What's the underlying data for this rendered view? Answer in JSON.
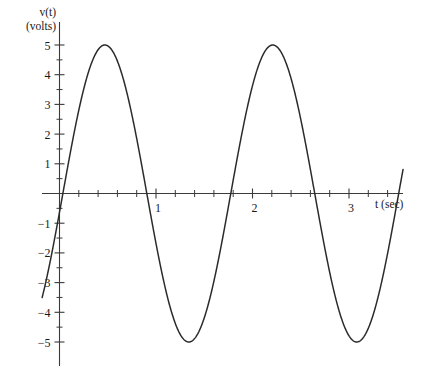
{
  "figure": {
    "background_color": "#ffffff",
    "curve_color": "#2b2b2b",
    "axis_color": "#3a3a3a"
  },
  "axis_labels": {
    "y_line1": "v(t)",
    "y_line2": "(volts)",
    "x_label": "t (sec)"
  },
  "y_ticks": [
    {
      "value": 5,
      "label": "5"
    },
    {
      "value": 4,
      "label": "4"
    },
    {
      "value": 3,
      "label": "3"
    },
    {
      "value": 2,
      "label": "2"
    },
    {
      "value": 1,
      "label": "1"
    },
    {
      "value": 0,
      "label": ""
    },
    {
      "value": -1,
      "label": "−1"
    },
    {
      "value": -2,
      "label": "−2"
    },
    {
      "value": -3,
      "label": "−3"
    },
    {
      "value": -4,
      "label": "−4"
    },
    {
      "value": -5,
      "label": "−5"
    }
  ],
  "y_minor_ticks": [
    4.5,
    3.5,
    2.5,
    1.5,
    0.5,
    -0.5,
    -1.5,
    -2.5,
    -3.5,
    -4.5
  ],
  "x_ticks": [
    {
      "value": 1,
      "label": "1"
    },
    {
      "value": 2,
      "label": "2"
    },
    {
      "value": 3,
      "label": "3"
    }
  ],
  "x_minor_ticks": [
    0.2,
    0.4,
    0.6,
    0.8,
    1.2,
    1.4,
    1.6,
    1.8,
    2.2,
    2.4,
    2.6,
    2.8,
    3.2,
    3.4
  ],
  "chart_data": {
    "type": "line",
    "title": "",
    "xlabel": "t (sec)",
    "ylabel": "v(t) (volts)",
    "xlim": [
      -0.18,
      3.6
    ],
    "ylim": [
      -5.6,
      5.6
    ],
    "grid": false,
    "legend": "none",
    "xticks": [
      1,
      2,
      3
    ],
    "xticklabels": [
      "1",
      "2",
      "3"
    ],
    "yticks": [
      -5,
      -4,
      -3,
      -2,
      -1,
      0,
      1,
      2,
      3,
      4,
      5
    ],
    "yticklabels": [
      "−5",
      "−4",
      "−3",
      "−2",
      "−1",
      "",
      "1",
      "2",
      "3",
      "4",
      "5"
    ],
    "series": [
      {
        "name": "v(t)",
        "form": "sinusoid",
        "amplitude": 5,
        "period_sec": 1.74,
        "frequency_hz": 0.575,
        "phase_zero_crossing_rising_sec": 0.035,
        "equation": "v(t) = 5 sin(2π(t − 0.035)/1.74)",
        "x": [
          -0.18,
          -0.1,
          0.0,
          0.1,
          0.2,
          0.3,
          0.4,
          0.47,
          0.6,
          0.7,
          0.8,
          0.9,
          1.0,
          1.1,
          1.2,
          1.3,
          1.34,
          1.45,
          1.55,
          1.65,
          1.75,
          1.85,
          1.95,
          2.05,
          2.21,
          2.35,
          2.45,
          2.55,
          2.65,
          2.75,
          2.85,
          2.95,
          3.05,
          3.08,
          3.2,
          3.3,
          3.4,
          3.5,
          3.55
        ],
        "y": [
          -4.75,
          -2.42,
          0.63,
          3.08,
          4.45,
          4.99,
          4.51,
          3.92,
          2.0,
          0.36,
          -1.4,
          -2.96,
          -4.13,
          -4.82,
          -4.98,
          -4.53,
          -4.33,
          -3.09,
          -1.63,
          0.09,
          1.78,
          3.26,
          4.4,
          4.93,
          5.0,
          4.3,
          3.28,
          1.9,
          0.27,
          -1.42,
          -2.98,
          -4.2,
          -4.9,
          -4.95,
          -4.64,
          -3.78,
          -2.5,
          -0.95,
          -1.4
        ],
        "key_points": {
          "maxima": [
            {
              "t": 0.47,
              "v": 5.0
            },
            {
              "t": 2.21,
              "v": 5.0
            }
          ],
          "minima": [
            {
              "t": 1.34,
              "v": -4.95
            },
            {
              "t": 3.08,
              "v": -4.95
            }
          ],
          "zero_crossings": [
            0.035,
            0.905,
            1.775,
            2.645,
            3.515
          ],
          "start_point": {
            "t": -0.18,
            "v": -4.75
          },
          "end_point": {
            "t": 3.56,
            "v": -1.4
          }
        }
      }
    ]
  }
}
